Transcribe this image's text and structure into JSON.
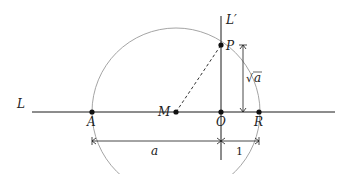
{
  "diagram": {
    "lines": {
      "L": {
        "label": "L",
        "x1": 32,
        "y1": 112,
        "x2": 335,
        "y2": 112
      },
      "L_prime": {
        "label": "L′",
        "x1": 221,
        "y1": 16,
        "x2": 221,
        "y2": 160
      }
    },
    "circle": {
      "center": "M",
      "cx": 176,
      "cy": 112,
      "r": 84,
      "color": "#9a9a9a"
    },
    "points": [
      {
        "id": "A",
        "label": "A",
        "x": 92,
        "y": 112
      },
      {
        "id": "M",
        "label": "M",
        "x": 176,
        "y": 112
      },
      {
        "id": "O",
        "label": "O",
        "x": 221,
        "y": 112
      },
      {
        "id": "R",
        "label": "R",
        "x": 259,
        "y": 112
      },
      {
        "id": "P",
        "label": "P",
        "x": 221,
        "y": 45
      }
    ],
    "segments": {
      "MP": {
        "style": "dashed",
        "from": "M",
        "to": "P"
      }
    },
    "dimensions": {
      "sqrt_a": {
        "label_radical": "√",
        "label_var": "a",
        "x": 243,
        "y1": 45,
        "y2": 112
      },
      "a": {
        "label": "a",
        "x1": 92,
        "x2": 221,
        "y": 141
      },
      "one": {
        "label": "1",
        "x1": 221,
        "x2": 259,
        "y": 141
      }
    },
    "colors": {
      "line": "#1a1a1a",
      "circle": "#9a9a9a",
      "point": "#111111"
    }
  }
}
